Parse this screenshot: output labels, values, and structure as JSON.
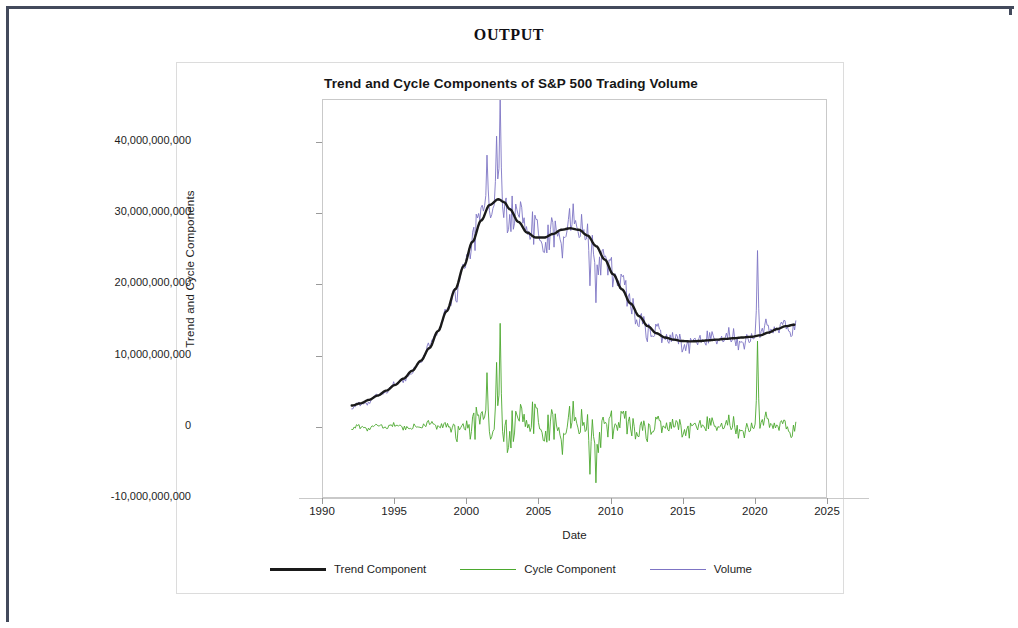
{
  "page": {
    "heading": "OUTPUT"
  },
  "chart_data": {
    "type": "line",
    "title": "Trend and Cycle Components of S&P 500 Trading Volume",
    "xlabel": "Date",
    "ylabel": "Trend and Cycle Components",
    "xlim": [
      1990,
      2025
    ],
    "ylim": [
      -10000000000,
      46000000000
    ],
    "grid": false,
    "legend_position": "bottom",
    "xticks": [
      "1990",
      "1995",
      "2000",
      "2005",
      "2010",
      "2015",
      "2020",
      "2025"
    ],
    "xtick_values": [
      1990,
      1995,
      2000,
      2005,
      2010,
      2015,
      2020,
      2025
    ],
    "yticks": [
      "40,000,000,000",
      "30,000,000,000",
      "20,000,000,000",
      "10,000,000,000",
      "0",
      "-10,000,000,000"
    ],
    "ytick_values": [
      40000000000,
      30000000000,
      20000000000,
      10000000000,
      0,
      -10000000000
    ],
    "colors": {
      "trend": "#1a1a1a",
      "cycle": "#4ba82e",
      "volume": "#7d74c4"
    },
    "series": [
      {
        "name": "Trend Component",
        "color": "#1a1a1a",
        "x": [
          1992.0,
          1992.6,
          1993.2,
          1993.8,
          1994.4,
          1995.0,
          1995.6,
          1996.2,
          1996.8,
          1997.4,
          1998.0,
          1998.6,
          1999.2,
          1999.8,
          2000.4,
          2001.0,
          2001.6,
          2002.2,
          2002.6,
          2003.0,
          2003.6,
          2004.2,
          2004.8,
          2005.4,
          2006.0,
          2006.6,
          2007.2,
          2007.8,
          2008.4,
          2009.0,
          2009.6,
          2010.2,
          2010.8,
          2011.4,
          2012.0,
          2012.6,
          2013.2,
          2013.8,
          2014.4,
          2015.0,
          2015.6,
          2016.2,
          2016.8,
          2017.4,
          2018.0,
          2018.6,
          2019.2,
          2019.8,
          2020.4,
          2021.0,
          2021.6,
          2022.2,
          2022.8
        ],
        "values": [
          2900000000,
          3200000000,
          3700000000,
          4300000000,
          5000000000,
          5800000000,
          6700000000,
          7800000000,
          9200000000,
          11000000000,
          13400000000,
          16200000000,
          19300000000,
          22600000000,
          26000000000,
          29000000000,
          31200000000,
          32000000000,
          31600000000,
          30600000000,
          28800000000,
          27300000000,
          26600000000,
          26600000000,
          27100000000,
          27700000000,
          27900000000,
          27700000000,
          26900000000,
          25400000000,
          23500000000,
          21400000000,
          19300000000,
          17300000000,
          15500000000,
          14100000000,
          13100000000,
          12500000000,
          12200000000,
          12000000000,
          11950000000,
          12000000000,
          12100000000,
          12200000000,
          12300000000,
          12400000000,
          12500000000,
          12600000000,
          12800000000,
          13200000000,
          13700000000,
          14100000000,
          14300000000
        ]
      },
      {
        "name": "Volume",
        "color": "#7d74c4",
        "description": "Monthly S&P 500 trading volume, noisy series oscillating about the trend; peak near 46 billion in 2002, secondary peaks near 36 billion in 2005-2009, sharp isolated spike near 26 billion in early 2020.",
        "x_start": 1992.0,
        "x_end": 2022.9,
        "peak_value": 46000000000,
        "peak_year": 2002.3,
        "spike_2020_value": 26000000000,
        "start_value": 3000000000,
        "end_value": 14500000000,
        "noise_amplitude": 4200000000
      },
      {
        "name": "Cycle Component",
        "color": "#4ba82e",
        "description": "Residual cycle component oscillating around zero; amplitude grows after 2000, maximum near 14.5 billion in 2002, minimum near -8 billion in 2009, isolated spike near 12 billion in 2020.",
        "x_start": 1992.0,
        "x_end": 2022.9,
        "mean": 0,
        "max_value": 14500000000,
        "max_year": 2002.3,
        "min_value": -8000000000,
        "min_year": 2009.0,
        "spike_2020_value": 12000000000,
        "noise_amplitude": 4200000000
      }
    ],
    "legend": [
      {
        "label": "Trend Component",
        "color": "#1a1a1a",
        "style": "thick"
      },
      {
        "label": "Cycle Component",
        "color": "#4ba82e",
        "style": "thin"
      },
      {
        "label": "Volume",
        "color": "#7d74c4",
        "style": "thin"
      }
    ]
  }
}
